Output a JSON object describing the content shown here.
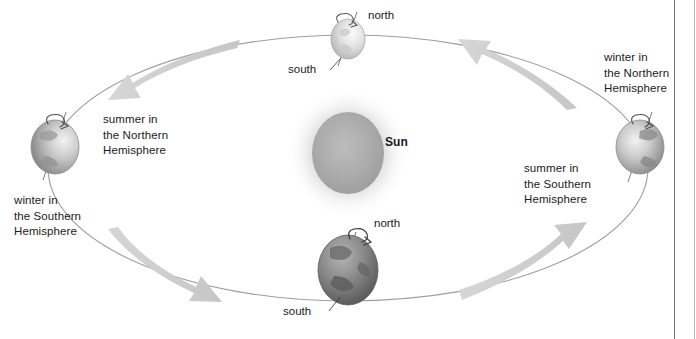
{
  "figure": {
    "background_color": "#ffffff",
    "width": 696,
    "height": 339
  },
  "sun": {
    "label": "Sun",
    "color": "#a8a8a8",
    "glow_color": "#d9d9d9",
    "center_x": 348,
    "center_y": 153,
    "radius_x": 36,
    "radius_y": 41
  },
  "orbit": {
    "stroke_color": "#9a9a9a",
    "center_x": 348,
    "center_y": 168,
    "radius_x": 300,
    "radius_y": 133
  },
  "arrows": {
    "color": "#cfcfcf",
    "items": [
      {
        "name": "top-left-arrow",
        "direction": "left"
      },
      {
        "name": "top-right-arrow",
        "direction": "left"
      },
      {
        "name": "bottom-left-arrow",
        "direction": "right"
      },
      {
        "name": "bottom-right-arrow",
        "direction": "right"
      }
    ]
  },
  "earths": [
    {
      "position": "top",
      "icon": "earth-icon",
      "shade": "light",
      "rotation_icon": "rotation-arrow-icon",
      "pole_labels": {
        "top": "north",
        "bottom": "south"
      }
    },
    {
      "position": "right",
      "icon": "earth-icon",
      "shade": "medium",
      "rotation_icon": "rotation-arrow-icon",
      "pole_labels": {
        "top": "",
        "bottom": ""
      }
    },
    {
      "position": "bottom",
      "icon": "earth-icon",
      "shade": "dark",
      "rotation_icon": "rotation-arrow-icon",
      "pole_labels": {
        "top": "north",
        "bottom": "south"
      }
    },
    {
      "position": "left",
      "icon": "earth-icon",
      "shade": "medium",
      "rotation_icon": "rotation-arrow-icon",
      "pole_labels": {
        "top": "",
        "bottom": ""
      }
    }
  ],
  "season_labels": {
    "left_upper": "summer in\nthe Northern\nHemisphere",
    "left_lower": "winter in\nthe Southern\nHemisphere",
    "right_upper": "winter in\nthe Northern\nHemisphere",
    "right_lower": "summer in\nthe Southern\nHemisphere"
  },
  "pole_labels": {
    "top_north": "north",
    "top_south": "south",
    "bottom_north": "north",
    "bottom_south": "south"
  }
}
